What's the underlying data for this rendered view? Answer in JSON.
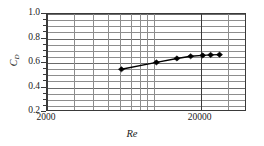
{
  "chart_data": {
    "type": "line",
    "title": "",
    "subtitle": "",
    "xlabel": "Re",
    "ylabel": "C_D",
    "ylabel_base": "C",
    "ylabel_sub": "D",
    "xscale": "log",
    "yscale": "linear",
    "xlim": [
      2000,
      40000
    ],
    "ylim": [
      0.2,
      1.0
    ],
    "grid": true,
    "legend": "none",
    "xtick_labels": [
      "2000",
      "20000"
    ],
    "xtick_values": [
      2000,
      20000
    ],
    "ytick_labels": [
      "0.2",
      "0.4",
      "0.6",
      "0.8",
      "1.0"
    ],
    "ytick_values": [
      0.2,
      0.4,
      0.6,
      0.8,
      1.0
    ],
    "y_minor_step": 0.05,
    "marker": "diamond",
    "marker_color": "#000000",
    "line_color": "#000000",
    "series": [
      {
        "name": "C_D vs Re",
        "x": [
          6100,
          10300,
          14000,
          17200,
          20600,
          23200,
          26500
        ],
        "y": [
          0.549,
          0.605,
          0.637,
          0.655,
          0.662,
          0.666,
          0.668
        ]
      }
    ]
  },
  "figure": {
    "background_color": "#ffffff",
    "frame_color": "#3a3a3a",
    "grid_color": "#8d8d8d"
  }
}
